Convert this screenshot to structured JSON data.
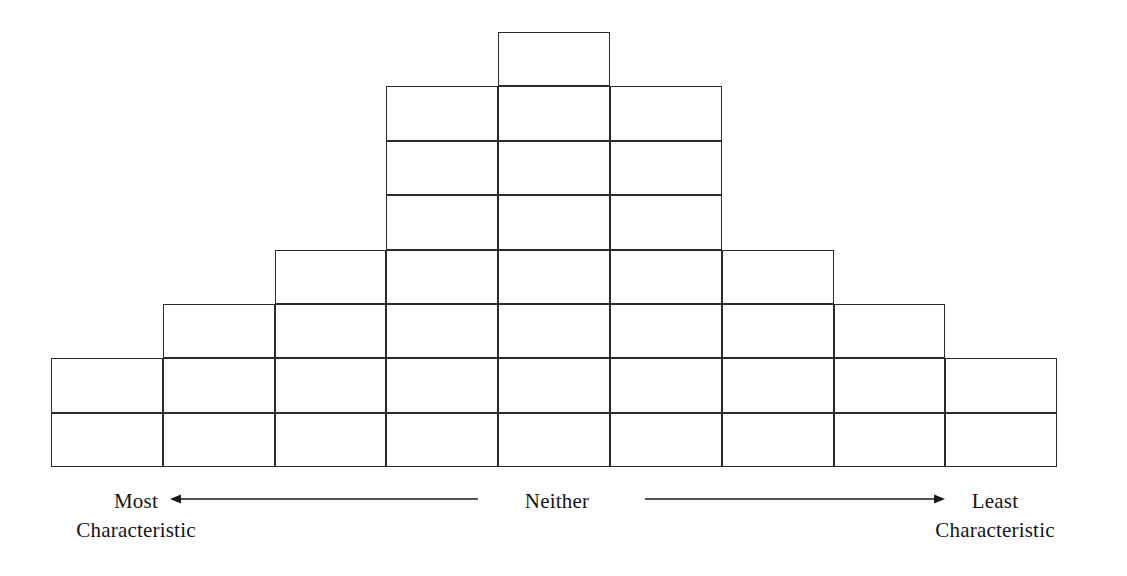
{
  "diagram": {
    "type": "q-sort-grid",
    "columns": 9,
    "rows": 8,
    "total_cells": 36,
    "column_capacities": [
      2,
      3,
      4,
      5,
      8,
      5,
      4,
      3,
      2
    ],
    "row_widths": [
      1,
      3,
      3,
      3,
      5,
      7,
      9,
      9
    ],
    "row_start_columns": [
      5,
      4,
      4,
      4,
      3,
      2,
      1,
      1
    ],
    "grid_geometry": {
      "left": 51,
      "top": 32,
      "cell_width": 111.8,
      "cell_height": 54.4,
      "line_color": "#2b2b2b",
      "line_width": 1.3,
      "fill": "transparent"
    }
  },
  "axis": {
    "left_label_line1": "Most",
    "left_label_line2": "Characteristic",
    "center_label": "Neither",
    "right_label_line1": "Least",
    "right_label_line2": "Characteristic",
    "left_arrow_direction": "left",
    "right_arrow_direction": "right",
    "arrow_color": "#1a1a1a"
  },
  "chart_data": {
    "type": "bar",
    "categories": [
      "Most Characteristic",
      "col 2",
      "col 3",
      "col 4",
      "Neither",
      "col 6",
      "col 7",
      "col 8",
      "Least Characteristic"
    ],
    "values": [
      2,
      3,
      4,
      5,
      8,
      5,
      4,
      3,
      2
    ],
    "xlabel": "Most Characteristic  ←  Neither  →  Least Characteristic",
    "ylabel": "Number of cells (items) per column",
    "ylim": [
      0,
      8
    ],
    "grid": false,
    "legend": false
  }
}
